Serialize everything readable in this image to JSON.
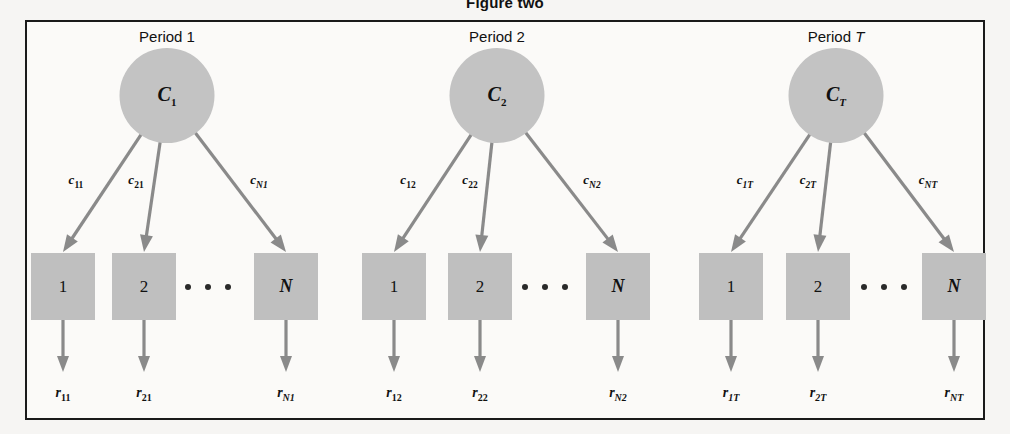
{
  "figure": {
    "title": "Figure two",
    "frame": {
      "x": 25,
      "y": 20,
      "width": 960,
      "height": 400,
      "border_color": "#1a1a1a"
    }
  },
  "colors": {
    "page_background": "#f6f5f3",
    "panel_background": "#fbfaf8",
    "node_fill": "#c3c3c3",
    "box_fill": "#bfbfbf",
    "connector": "#8a8a8a",
    "text": "#111111"
  },
  "diagram": {
    "type": "tree-fan",
    "group_count": 3,
    "branches_per_group": 3,
    "groups": [
      {
        "title_prefix": "Period ",
        "title_suffix": "1",
        "title_suffix_italic": false,
        "center_x": 167,
        "node": {
          "base": "C",
          "sub": "1",
          "sub_italic": false,
          "cx": 167,
          "cy": 48
        },
        "boxes": [
          {
            "label": "1",
            "italic": false,
            "cx": 63
          },
          {
            "label": "2",
            "italic": false,
            "cx": 144
          },
          {
            "label": "N",
            "italic": true,
            "cx": 286
          }
        ],
        "dots_cx": 208,
        "edge_labels": [
          {
            "base": "c",
            "sub": "11",
            "sub_italic": false,
            "cx": 76
          },
          {
            "base": "c",
            "sub": "21",
            "sub_italic": false,
            "cx": 136
          },
          {
            "base": "c",
            "sub": "N1",
            "sub_italic": true,
            "cx": 259
          }
        ],
        "out_labels": [
          {
            "base": "r",
            "sub": "11",
            "sub_italic": false,
            "cx": 63
          },
          {
            "base": "r",
            "sub": "21",
            "sub_italic": false,
            "cx": 144
          },
          {
            "base": "r",
            "sub": "N1",
            "sub_italic": true,
            "cx": 286
          }
        ]
      },
      {
        "title_prefix": "Period ",
        "title_suffix": "2",
        "title_suffix_italic": false,
        "center_x": 497,
        "node": {
          "base": "C",
          "sub": "2",
          "sub_italic": false,
          "cx": 497,
          "cy": 48
        },
        "boxes": [
          {
            "label": "1",
            "italic": false,
            "cx": 394
          },
          {
            "label": "2",
            "italic": false,
            "cx": 480
          },
          {
            "label": "N",
            "italic": true,
            "cx": 618
          }
        ],
        "dots_cx": 545,
        "edge_labels": [
          {
            "base": "c",
            "sub": "12",
            "sub_italic": false,
            "cx": 408
          },
          {
            "base": "c",
            "sub": "22",
            "sub_italic": false,
            "cx": 470
          },
          {
            "base": "c",
            "sub": "N2",
            "sub_italic": true,
            "cx": 592
          }
        ],
        "out_labels": [
          {
            "base": "r",
            "sub": "12",
            "sub_italic": false,
            "cx": 394
          },
          {
            "base": "r",
            "sub": "22",
            "sub_italic": false,
            "cx": 480
          },
          {
            "base": "r",
            "sub": "N2",
            "sub_italic": true,
            "cx": 618
          }
        ]
      },
      {
        "title_prefix": "Period ",
        "title_suffix": "T",
        "title_suffix_italic": true,
        "center_x": 836,
        "node": {
          "base": "C",
          "sub": "T",
          "sub_italic": true,
          "cx": 836,
          "cy": 48
        },
        "boxes": [
          {
            "label": "1",
            "italic": false,
            "cx": 731
          },
          {
            "label": "2",
            "italic": false,
            "cx": 818
          },
          {
            "label": "N",
            "italic": true,
            "cx": 954
          }
        ],
        "dots_cx": 884,
        "edge_labels": [
          {
            "base": "c",
            "sub": "1T",
            "sub_italic": true,
            "cx": 745
          },
          {
            "base": "c",
            "sub": "2T",
            "sub_italic": true,
            "cx": 808
          },
          {
            "base": "c",
            "sub": "NT",
            "sub_italic": true,
            "cx": 928
          }
        ],
        "out_labels": [
          {
            "base": "r",
            "sub": "1T",
            "sub_italic": true,
            "cx": 731
          },
          {
            "base": "r",
            "sub": "2T",
            "sub_italic": true,
            "cx": 818
          },
          {
            "base": "r",
            "sub": "NT",
            "sub_italic": true,
            "cx": 954
          }
        ]
      }
    ],
    "metrics": {
      "title_y": 28,
      "node_diameter": 95,
      "node_top_y": 48,
      "box_top_y": 253,
      "box_w": 64,
      "box_h": 67,
      "dots_cy": 287,
      "edge_label_y": 172,
      "out_label_y": 385,
      "out_arrow_end_y": 372
    }
  }
}
